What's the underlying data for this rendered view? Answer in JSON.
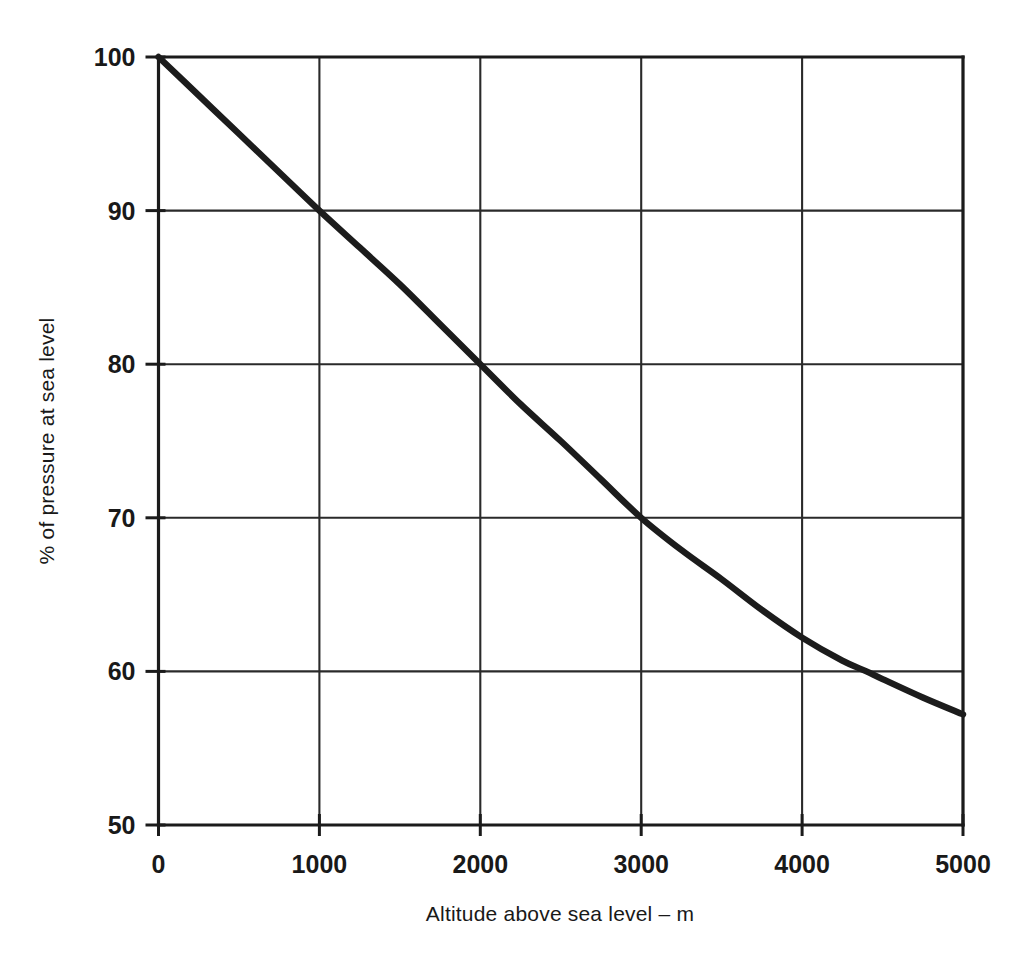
{
  "chart_data": {
    "type": "line",
    "title": "",
    "subtitle": "",
    "xlabel": "Altitude above sea level – m",
    "ylabel": "% of pressure at sea level",
    "xlim": [
      0,
      5000
    ],
    "ylim": [
      50,
      100
    ],
    "xticks": [
      0,
      1000,
      2000,
      3000,
      4000,
      5000
    ],
    "xtick_labels": [
      "0",
      "1000",
      "2000",
      "3000",
      "4000",
      "5000"
    ],
    "yticks": [
      50,
      60,
      70,
      80,
      90,
      100
    ],
    "ytick_labels": [
      "50",
      "60",
      "70",
      "80",
      "90",
      "100"
    ],
    "grid": true,
    "grid_axes": "both",
    "legend": null,
    "legend_position": "none",
    "annotations": [],
    "series": [
      {
        "name": "Atmospheric pressure vs altitude",
        "color": "#1c1c1c",
        "line_width": 6.4,
        "x": [
          0,
          250,
          500,
          750,
          1000,
          1250,
          1500,
          1750,
          2000,
          2250,
          2500,
          2750,
          3000,
          3250,
          3500,
          3750,
          4000,
          4250,
          4400,
          4500,
          4750,
          5000
        ],
        "y": [
          100.0,
          97.5,
          95.0,
          92.5,
          90.0,
          87.6,
          85.2,
          82.6,
          80.0,
          77.4,
          75.0,
          72.5,
          70.0,
          67.9,
          66.0,
          64.0,
          62.2,
          60.7,
          60.0,
          59.5,
          58.3,
          57.2
        ]
      }
    ],
    "key_points": [
      {
        "x": 0,
        "y": 100
      },
      {
        "x": 1000,
        "y": 90
      },
      {
        "x": 2000,
        "y": 80
      },
      {
        "x": 3000,
        "y": 70
      },
      {
        "x": 4000,
        "y": 62.2
      },
      {
        "x": 4400,
        "y": 60
      },
      {
        "x": 5000,
        "y": 57.2
      }
    ]
  },
  "colors": {
    "background": "#ffffff",
    "axis": "#1b1b1b",
    "grid": "#2a2a2a",
    "curve": "#1c1c1c",
    "text": "#191919"
  }
}
